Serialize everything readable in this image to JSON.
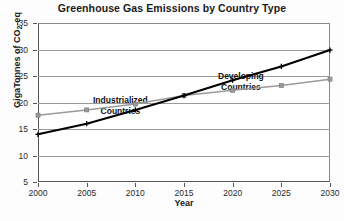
{
  "chart_data": {
    "type": "line",
    "title": "Greenhouse Gas Emissions by Country Type",
    "xlabel": "Year",
    "ylabel": "GigaTonnes of CO2-eq",
    "ylabel_parts": {
      "pre": "GigaTonnes of CO",
      "sub": "2",
      "post": "-eq"
    },
    "x": [
      2000,
      2005,
      2010,
      2015,
      2020,
      2025,
      2030
    ],
    "xlim": [
      2000,
      2030
    ],
    "ylim": [
      5,
      35
    ],
    "yticks": [
      5,
      10,
      15,
      20,
      25,
      30,
      35
    ],
    "xticks": [
      2000,
      2005,
      2010,
      2015,
      2020,
      2025,
      2030
    ],
    "grid": true,
    "legend": "annotations-inline",
    "series": [
      {
        "name": "Developing Countries",
        "color": "#000000",
        "marker": "plus",
        "values": [
          14.0,
          16.0,
          18.6,
          21.3,
          24.2,
          26.8,
          29.9
        ]
      },
      {
        "name": "Industrialized Countries",
        "color": "#9a9a9a",
        "marker": "square",
        "values": [
          17.6,
          18.6,
          19.7,
          21.3,
          22.3,
          23.2,
          24.4
        ]
      }
    ],
    "annotations": [
      {
        "text_line1": "Industrialized",
        "text_line2": "Countries"
      },
      {
        "text_line1": "Developing",
        "text_line2": "Countries"
      }
    ]
  }
}
